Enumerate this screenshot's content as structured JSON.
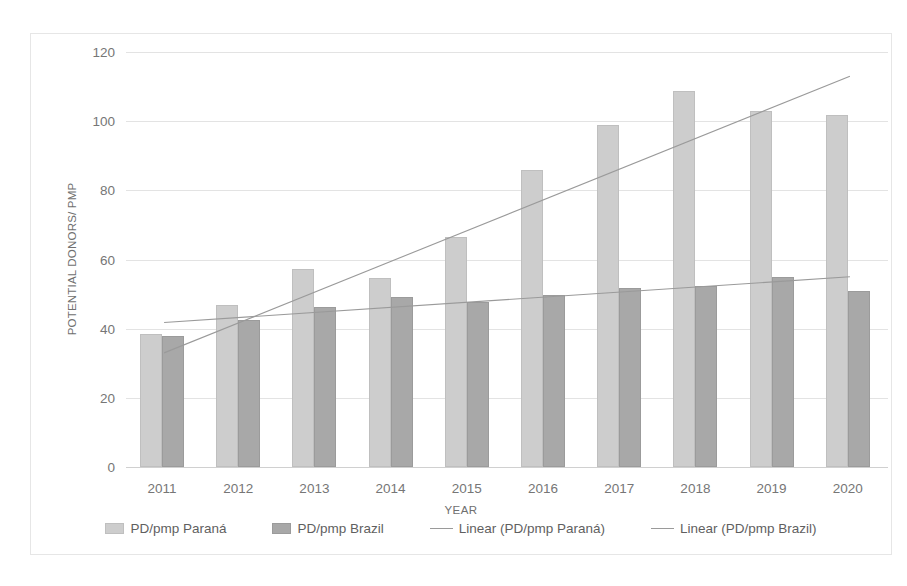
{
  "chart_data": {
    "type": "bar",
    "title": "",
    "xlabel": "YEAR",
    "ylabel": "POTENTIAL DONORS/ PMP",
    "categories": [
      "2011",
      "2012",
      "2013",
      "2014",
      "2015",
      "2016",
      "2017",
      "2018",
      "2019",
      "2020"
    ],
    "ylim": [
      0,
      120
    ],
    "yticks": [
      0,
      20,
      40,
      60,
      80,
      100,
      120
    ],
    "grid": true,
    "legend_position": "bottom",
    "series": [
      {
        "name": "PD/pmp Paraná",
        "type": "bar",
        "color": "#cdcdcd",
        "values": [
          38.6,
          46.8,
          57.4,
          54.7,
          66.4,
          86.0,
          98.9,
          108.7,
          103.0,
          101.8
        ]
      },
      {
        "name": "PD/pmp Brazil",
        "type": "bar",
        "color": "#a8a8a8",
        "values": [
          38.0,
          42.6,
          46.3,
          49.1,
          47.8,
          49.8,
          51.7,
          52.2,
          54.8,
          50.8
        ]
      },
      {
        "name": "Linear (PD/pmp Paraná)",
        "type": "trendline",
        "color": "#9a9a9a",
        "endpoints": [
          {
            "x": "2011",
            "y": 33.0
          },
          {
            "x": "2020",
            "y": 113.0
          }
        ]
      },
      {
        "name": "Linear (PD/pmp Brazil)",
        "type": "trendline",
        "color": "#9a9a9a",
        "endpoints": [
          {
            "x": "2011",
            "y": 41.8
          },
          {
            "x": "2020",
            "y": 55.0
          }
        ]
      }
    ]
  },
  "axes": {
    "y_tick_labels": [
      "120",
      "100",
      "80",
      "60",
      "40",
      "20",
      "0"
    ],
    "y_title": "POTENTIAL DONORS/ PMP",
    "x_title": "YEAR",
    "x_tick_labels": [
      "2011",
      "2012",
      "2013",
      "2014",
      "2015",
      "2016",
      "2017",
      "2018",
      "2019",
      "2020"
    ]
  },
  "legend": {
    "items": [
      {
        "label": "PD/pmp Paraná",
        "marker": "bar-swatch-light"
      },
      {
        "label": "PD/pmp Brazil",
        "marker": "bar-swatch-dark"
      },
      {
        "label": "Linear (PD/pmp Paraná)",
        "marker": "line-swatch"
      },
      {
        "label": "Linear (PD/pmp Brazil)",
        "marker": "line-swatch"
      }
    ]
  },
  "colors": {
    "parana_bar": "#cdcdcd",
    "brazil_bar": "#a8a8a8",
    "trendline": "#9a9a9a",
    "gridline": "#e3e3e3",
    "text": "#767676",
    "frame_border": "#e6e6e6"
  }
}
